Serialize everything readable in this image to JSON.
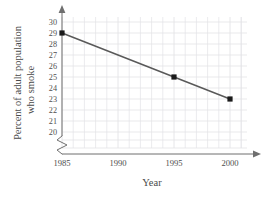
{
  "chart_data": {
    "type": "line",
    "title": "",
    "xlabel": "Year",
    "ylabel": "Percent of adult population who smoke",
    "ylabel_line1": "Percent of adult population",
    "ylabel_line2": "who smoke",
    "x": [
      1985,
      1995,
      2000
    ],
    "values": [
      29,
      25,
      23
    ],
    "points": [
      {
        "x": 1985,
        "y": 29
      },
      {
        "x": 1995,
        "y": 25
      },
      {
        "x": 2000,
        "y": 23
      }
    ],
    "xlim": [
      1985,
      2000
    ],
    "ylim": [
      20,
      30
    ],
    "xticks": [
      1985,
      1990,
      1995,
      2000
    ],
    "xtick_labels": [
      "1985",
      "1990",
      "1995",
      "2000"
    ],
    "yticks": [
      20,
      21,
      22,
      23,
      24,
      25,
      26,
      27,
      28,
      29,
      30
    ],
    "ytick_labels": [
      "20",
      "21",
      "22",
      "23",
      "24",
      "25",
      "26",
      "27",
      "28",
      "29",
      "30"
    ],
    "x_minor_step": 1,
    "grid": true,
    "legend": false,
    "y_axis_break": true,
    "marker": "square",
    "colors": {
      "line": "#595959",
      "marker": "#1a1a1a",
      "grid": "#e3e3e6",
      "axis": "#6f6f6f",
      "text": "#4a4a4a",
      "background": "#ffffff"
    }
  }
}
